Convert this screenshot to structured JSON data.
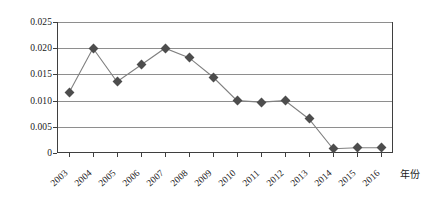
{
  "chart_data": {
    "type": "line",
    "title": "",
    "xlabel": "年份",
    "ylabel": "",
    "categories": [
      "2003",
      "2004",
      "2005",
      "2006",
      "2007",
      "2008",
      "2009",
      "2010",
      "2011",
      "2012",
      "2013",
      "2014",
      "2015",
      "2016"
    ],
    "values": [
      0.0115,
      0.02,
      0.0136,
      0.0168,
      0.02,
      0.0182,
      0.0145,
      0.01,
      0.0097,
      0.01,
      0.0065,
      0.0008,
      0.001,
      0.001
    ],
    "series": [
      {
        "name": "",
        "values": [
          0.0115,
          0.02,
          0.0136,
          0.0168,
          0.02,
          0.0182,
          0.0145,
          0.01,
          0.0097,
          0.01,
          0.0065,
          0.0008,
          0.001,
          0.001
        ]
      }
    ],
    "ylim": [
      0,
      0.025
    ],
    "y_ticks": [
      0,
      0.005,
      0.01,
      0.015,
      0.02,
      0.025
    ],
    "y_tick_labels": [
      "0",
      "0.005",
      "0.010",
      "0.015",
      "0.020",
      "0.025"
    ],
    "grid": true,
    "legend": false,
    "legend_position": "none",
    "marker": "diamond",
    "line_color": "#808080",
    "marker_color": "#4d4d4d",
    "grid_color": "#8e8e8e",
    "frame_color": "#3f3f3f",
    "x_tick_rotation": -42
  }
}
